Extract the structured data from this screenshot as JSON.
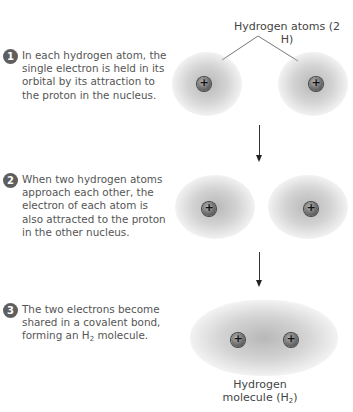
{
  "top_label": "Hydrogen atoms (2 H)",
  "steps": [
    {
      "number": "1",
      "text": "In each hydrogen atom, the single electron is held in its orbital by its attraction to the proton in the nucleus."
    },
    {
      "number": "2",
      "text": "When two hydrogen atoms approach each other, the electron of each atom is also attracted to the proton in the other nucleus."
    },
    {
      "number": "3",
      "text_before": "The two electrons become shared in a covalent bond, forming an H",
      "text_sub": "2",
      "text_after": " molecule."
    }
  ],
  "bottom_label": {
    "line1": "Hydrogen",
    "line2_before": "molecule (H",
    "line2_sub": "2",
    "line2_after": ")"
  },
  "proton_symbol": "+",
  "colors": {
    "cloud": "#a8a8a8",
    "proton": "#6e6e6e",
    "text": "#555555",
    "badge": "#5e5e5e"
  }
}
